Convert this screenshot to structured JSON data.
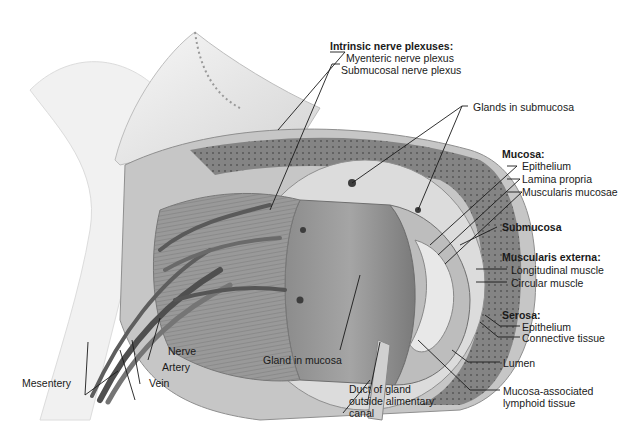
{
  "figure": {
    "labels": {
      "intrinsic_header": "Intrinsic nerve plexuses:",
      "myenteric": "Myenteric nerve plexus",
      "submucosal_plexus": "Submucosal nerve plexus",
      "glands_submucosa": "Glands in submucosa",
      "mucosa_header": "Mucosa:",
      "mucosa_epithelium": "Epithelium",
      "lamina_propria": "Lamina propria",
      "muscularis_mucosae": "Muscularis mucosae",
      "submucosa": "Submucosa",
      "muscularis_externa_header": "Muscularis externa:",
      "longitudinal_muscle": "Longitudinal muscle",
      "circular_muscle": "Circular muscle",
      "serosa_header": "Serosa:",
      "serosa_epithelium": "Epithelium",
      "connective_tissue": "Connective tissue",
      "lumen": "Lumen",
      "malt_line1": "Mucosa-associated",
      "malt_line2": "lymphoid tissue",
      "duct_line1": "Duct of gland",
      "duct_line2": "outside alimentary",
      "duct_line3": "canal",
      "gland_in_mucosa": "Gland in mucosa",
      "nerve": "Nerve",
      "artery": "Artery",
      "vein": "Vein",
      "mesentery": "Mesentery"
    },
    "colors": {
      "ink": "#1a1a1a",
      "tissue_light": "#e6e6e6",
      "tissue_mid": "#a9a9a9",
      "tissue_dark": "#6e6e6e",
      "vessel": "#5a5a5a"
    }
  }
}
